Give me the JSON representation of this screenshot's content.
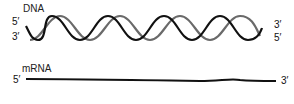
{
  "dna": {
    "label": "DNA",
    "left_top_end": "5′",
    "left_bottom_end": "3′",
    "right_top_end": "3′",
    "right_bottom_end": "5′",
    "strand_colors": {
      "front": "#111111",
      "back": "#666666"
    }
  },
  "mrna": {
    "label": "mRNA",
    "left_end": "5′",
    "right_end": "3′",
    "strand_color": "#111111"
  }
}
